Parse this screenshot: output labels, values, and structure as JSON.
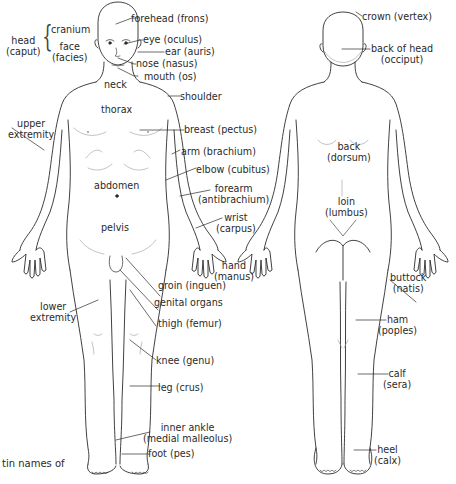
{
  "diagram": {
    "type": "anatomical body regions",
    "figures": [
      "anterior view",
      "posterior view"
    ],
    "caption_fragment": "tin names of",
    "front_labels": {
      "head": "head",
      "head_latin": "(caput)",
      "cranium": "cranium",
      "face": "face",
      "face_latin": "(facies)",
      "forehead": "forehead (frons)",
      "eye": "eye (oculus)",
      "ear": "ear (auris)",
      "nose": "nose (nasus)",
      "mouth": "mouth (os)",
      "neck": "neck",
      "shoulder": "shoulder",
      "thorax": "thorax",
      "upper_extremity_1": "upper",
      "upper_extremity_2": "extremity",
      "breast": "breast (pectus)",
      "arm": "arm (brachium)",
      "elbow": "elbow (cubitus)",
      "abdomen": "abdomen",
      "forearm_1": "forearm",
      "forearm_2": "(antibrachium)",
      "wrist_1": "wrist",
      "wrist_2": "(carpus)",
      "pelvis": "pelvis",
      "hand_1": "hand",
      "hand_2": "(manus)",
      "groin": "groin (inguen)",
      "genital": "genital organs",
      "lower_extremity_1": "lower",
      "lower_extremity_2": "extremity",
      "thigh": "thigh (femur)",
      "knee": "knee (genu)",
      "leg": "leg (crus)",
      "inner_ankle_1": "inner ankle",
      "inner_ankle_2": "(medial malleolus)",
      "foot": "foot (pes)"
    },
    "back_labels": {
      "crown": "crown (vertex)",
      "back_of_head_1": "back of head",
      "back_of_head_2": "(occiput)",
      "back_1": "back",
      "back_2": "(dorsum)",
      "loin_1": "loin",
      "loin_2": "(lumbus)",
      "buttock_1": "buttock",
      "buttock_2": "(natis)",
      "ham_1": "ham",
      "ham_2": "(poples)",
      "calf_1": "calf",
      "calf_2": "(sera)",
      "heel_1": "heel",
      "heel_2": "(calx)"
    },
    "colors": {
      "line": "#2b2b2b",
      "faint": "#9a9a9a",
      "text": "#2a2a2a",
      "background": "#ffffff"
    }
  }
}
